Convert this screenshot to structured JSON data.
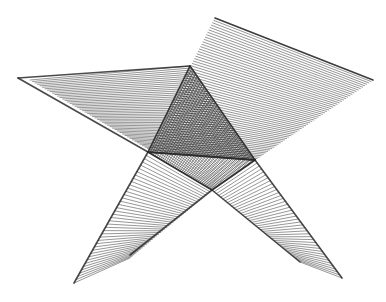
{
  "figure": {
    "kind": "ruled-surface line drawing",
    "background": "#ffffff",
    "ink": "#2a2a2a",
    "surfaces": [
      {
        "name": "upper-left-wing",
        "edgeA": [
          [
            18,
            78
          ],
          [
            190,
            66
          ]
        ],
        "edgeB": [
          [
            18,
            78
          ],
          [
            148,
            152
          ]
        ],
        "hatch_from": [
          [
            30,
            80
          ],
          [
            150,
            150
          ]
        ],
        "hatch_to": [
          [
            190,
            66
          ],
          [
            255,
            160
          ]
        ],
        "lines": 48
      },
      {
        "name": "upper-right-wing",
        "edgeA": [
          [
            215,
            18
          ],
          [
            373,
            80
          ]
        ],
        "edgeB": [
          [
            148,
            152
          ],
          [
            255,
            160
          ]
        ],
        "hatch_from": [
          [
            215,
            18
          ],
          [
            148,
            152
          ]
        ],
        "hatch_to": [
          [
            373,
            80
          ],
          [
            255,
            160
          ]
        ],
        "lines": 56
      },
      {
        "name": "lower-left-leg",
        "edgeA": [
          [
            148,
            152
          ],
          [
            74,
            283
          ]
        ],
        "edgeB": [
          [
            212,
            190
          ],
          [
            130,
            255
          ]
        ],
        "hatch_from": [
          [
            148,
            152
          ],
          [
            74,
            283
          ]
        ],
        "hatch_to": [
          [
            212,
            190
          ],
          [
            130,
            258
          ]
        ],
        "lines": 40
      },
      {
        "name": "lower-right-leg",
        "edgeA": [
          [
            255,
            160
          ],
          [
            342,
            278
          ]
        ],
        "edgeB": [
          [
            212,
            190
          ],
          [
            300,
            262
          ]
        ],
        "hatch_from": [
          [
            255,
            160
          ],
          [
            342,
            278
          ]
        ],
        "hatch_to": [
          [
            212,
            190
          ],
          [
            300,
            262
          ]
        ],
        "lines": 40
      }
    ],
    "core_triangle": {
      "apex": [
        190,
        66
      ],
      "left": [
        148,
        152
      ],
      "right": [
        255,
        160
      ],
      "bottom": [
        212,
        190
      ]
    }
  }
}
